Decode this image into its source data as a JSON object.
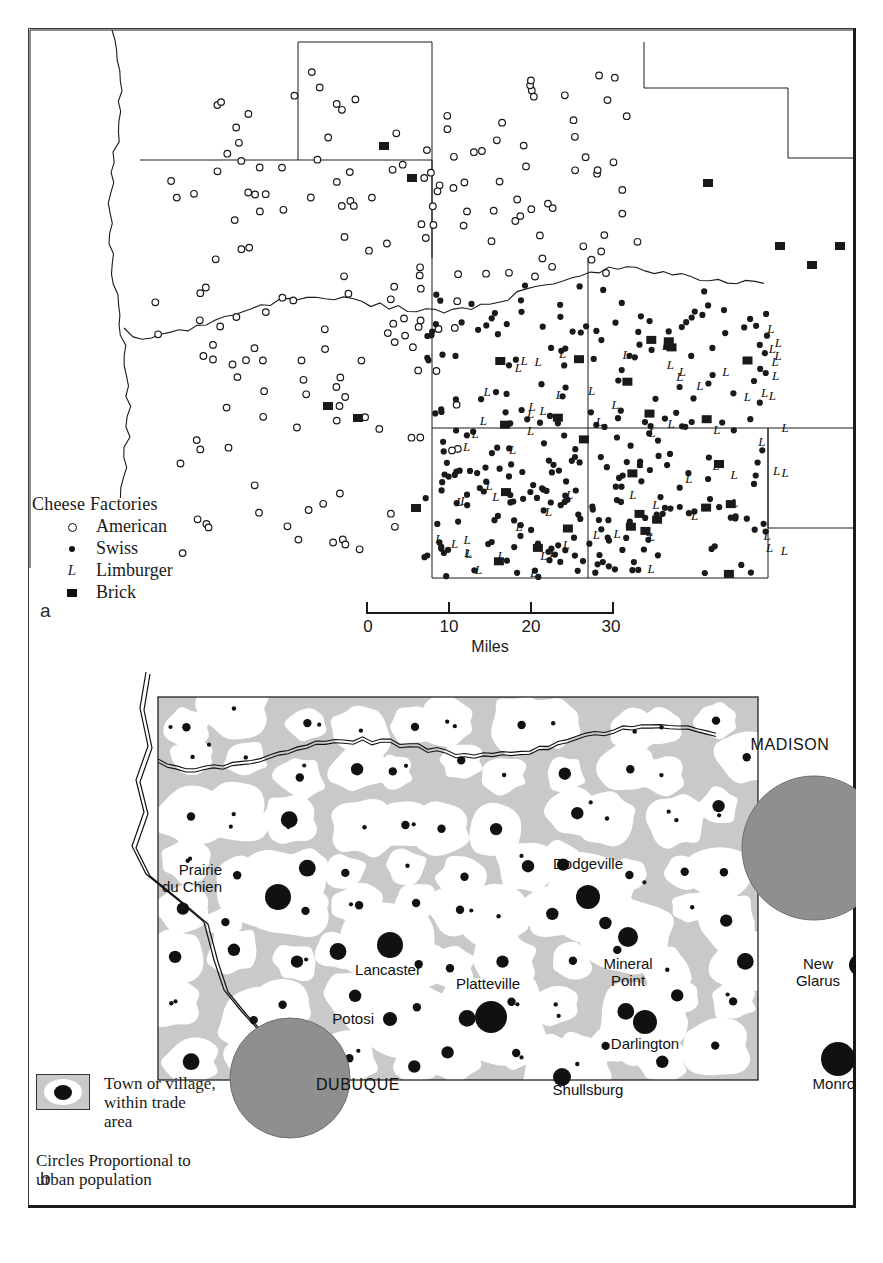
{
  "figure": {
    "panel_a_label": "a",
    "panel_b_label": "b"
  },
  "panel_a": {
    "legend": {
      "title": "Cheese Factories",
      "items": [
        {
          "symbol": "open-circle",
          "label": "American"
        },
        {
          "symbol": "filled-dot",
          "label": "Swiss"
        },
        {
          "symbol": "letter-L",
          "glyph": "L",
          "label": "Limburger"
        },
        {
          "symbol": "filled-square",
          "label": "Brick"
        }
      ]
    },
    "scale": {
      "ticks": [
        "0",
        "10",
        "20",
        "30"
      ],
      "units": "Miles"
    }
  },
  "panel_b": {
    "legend": {
      "swatch_label_lines": [
        "Town or village,",
        "within trade",
        "area"
      ],
      "note_lines": [
        "Circles Proportional to",
        "urban population"
      ]
    },
    "towns": [
      {
        "name": "Prairie\ndu Chien",
        "x": 64,
        "y": 178,
        "anchor": "end",
        "dot_x": 120,
        "dot_y": 200,
        "r": 13
      },
      {
        "name": "Dodgeville",
        "x": 430,
        "y": 172,
        "anchor": "middle",
        "dot_x": 430,
        "dot_y": 200,
        "r": 12
      },
      {
        "name": "Lancaster",
        "x": 230,
        "y": 278,
        "anchor": "middle",
        "dot_x": 232,
        "dot_y": 248,
        "r": 13
      },
      {
        "name": "Platteville",
        "x": 330,
        "y": 292,
        "anchor": "middle",
        "dot_x": 333,
        "dot_y": 320,
        "r": 16
      },
      {
        "name": "Mineral\nPoint",
        "x": 470,
        "y": 272,
        "anchor": "middle",
        "dot_x": 470,
        "dot_y": 240,
        "r": 10
      },
      {
        "name": "New\nGlarus",
        "x": 660,
        "y": 272,
        "anchor": "middle",
        "dot_x": 702,
        "dot_y": 268,
        "r": 11
      },
      {
        "name": "Darlington",
        "x": 487,
        "y": 352,
        "anchor": "middle",
        "dot_x": 487,
        "dot_y": 325,
        "r": 12
      },
      {
        "name": "Potosi",
        "x": 216,
        "y": 327,
        "anchor": "end",
        "dot_x": 232,
        "dot_y": 322,
        "r": 7
      },
      {
        "name": "Shullsburg",
        "x": 430,
        "y": 398,
        "anchor": "middle",
        "dot_x": 404,
        "dot_y": 380,
        "r": 9
      },
      {
        "name": "Monroe",
        "x": 680,
        "y": 392,
        "anchor": "middle",
        "dot_x": 680,
        "dot_y": 362,
        "r": 17
      }
    ],
    "cities": [
      {
        "name": "MADISON",
        "label_x": 762,
        "label_y": 90,
        "cx": 786,
        "cy": 188,
        "r": 72
      },
      {
        "name": "DUBUQUE",
        "label_x": 330,
        "label_y": 430,
        "cx": 262,
        "cy": 418,
        "r": 60
      }
    ]
  },
  "colors": {
    "ink": "#1a1a1a",
    "frame": "#1b1b1b",
    "trade_area_gray": "#c9c9c9",
    "city_gray": "#8f8f8f",
    "paper": "#ffffff"
  },
  "chart_data": {
    "type": "map",
    "panels": [
      {
        "id": "a",
        "subject": "Cheese factory types by location",
        "legend_categories": [
          "American",
          "Swiss",
          "Limburger",
          "Brick"
        ],
        "scale_ticks": [
          0,
          10,
          20,
          30
        ],
        "scale_units": "Miles",
        "counts": {
          "American": 186,
          "Swiss": 243,
          "Limburger": 64,
          "Brick": 34
        }
      },
      {
        "id": "b",
        "subject": "Town and village trade areas, circles proportional to urban population",
        "labelled_towns": [
          "Prairie du Chien",
          "Dodgeville",
          "Lancaster",
          "Platteville",
          "Mineral Point",
          "New Glarus",
          "Darlington",
          "Potosi",
          "Shullsburg",
          "Monroe"
        ],
        "labelled_cities": [
          "MADISON",
          "DUBUQUE"
        ]
      }
    ]
  }
}
